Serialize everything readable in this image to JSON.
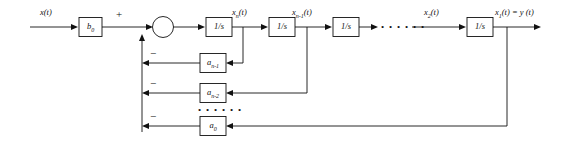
{
  "diagram": {
    "background_color": "#ffffff",
    "line_color": "#111111",
    "input": {
      "label_html": "x(t)",
      "name": "input-signal"
    },
    "output": {
      "label_html": "x<sub>1</sub>(t) = y (t)",
      "name": "output-signal"
    },
    "input_gain": {
      "label_html": "b<sub>0</sub>"
    },
    "summing_junction": {
      "plus_sign": "+",
      "minus_signs": [
        "−",
        "−",
        "−"
      ]
    },
    "integrators": [
      {
        "label": "1/s"
      },
      {
        "label": "1/s"
      },
      {
        "label": "1/s"
      },
      {
        "label": "1/s"
      }
    ],
    "node_labels": [
      {
        "html": "x<sub>n</sub>(t)"
      },
      {
        "html": "x<sub>n-1</sub>(t)"
      },
      {
        "html": "x<sub>2</sub>(t)"
      }
    ],
    "chain_ellipsis": "• • • • • •",
    "feedback_ellipsis": "• • • • • •",
    "feedback_gains": [
      {
        "label_html": "a<sub>n-1</sub>"
      },
      {
        "label_html": "a<sub>n-2</sub>"
      },
      {
        "label_html": "a<sub>0</sub>"
      }
    ]
  }
}
